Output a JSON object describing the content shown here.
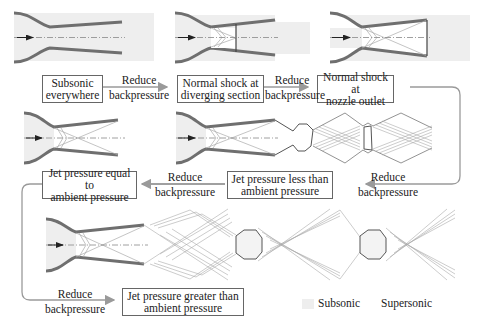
{
  "stages": [
    {
      "id": "subsonic",
      "label": "Subsonic everywhere",
      "line1": "Subsonic",
      "line2": "everywhere"
    },
    {
      "id": "shock-diverging",
      "label": "Normal shock at diverging section",
      "line1": "Normal shock at",
      "line2": "diverging section"
    },
    {
      "id": "shock-outlet",
      "label": "Normal shock at nozzle outlet",
      "line1": "Normal shock at",
      "line2": "nozzle outlet"
    },
    {
      "id": "jet-less",
      "label": "Jet pressure less than ambient pressure",
      "line1": "Jet pressure less than",
      "line2": "ambient pressure"
    },
    {
      "id": "jet-equal",
      "label": "Jet pressure equal to ambient pressure",
      "line1": "Jet pressure equal to",
      "line2": "ambient pressure"
    },
    {
      "id": "jet-greater",
      "label": "Jet pressure greater than ambient pressure",
      "line1": "Jet pressure greater than",
      "line2": "ambient pressure"
    }
  ],
  "transition": {
    "line1": "Reduce",
    "line2": "backpressure"
  },
  "legend": {
    "subsonic": "Subsonic",
    "supersonic": "Supersonic",
    "subsonic_color": "#eeeeee"
  },
  "colors": {
    "wall": "#6f6f6f",
    "wall_highlight": "#a0a0a0",
    "wave": "#9a9a9a",
    "arrow": "#999999",
    "subsonic_fill": "#eeeeee"
  }
}
